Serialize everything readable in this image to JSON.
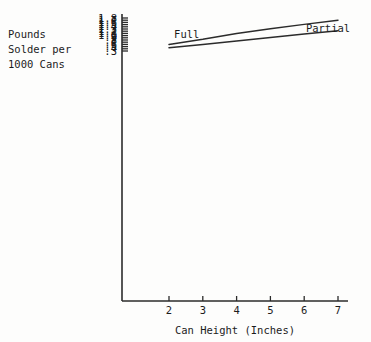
{
  "chart_data": {
    "type": "line",
    "title": "",
    "xlabel": "Can Height (Inches)",
    "ylabel": "Pounds Solder per 1000 Cans",
    "ylabel_lines": [
      "Pounds",
      "Solder per",
      "1000 Cans"
    ],
    "xlim": [
      1.5,
      7.5
    ],
    "ylim": [
      0.25,
      1.85
    ],
    "grid": false,
    "legend_position": "inline-annotations",
    "x_ticks": [
      2,
      3,
      4,
      5,
      6,
      7
    ],
    "x_tick_labels": [
      "2",
      "3",
      "4",
      "5",
      "6",
      "7"
    ],
    "y_ticks": [
      0.3,
      0.4,
      0.5,
      0.6,
      0.7,
      0.8,
      0.9,
      1.0,
      1.1,
      1.2,
      1.3,
      1.4,
      1.5,
      1.6,
      1.7,
      1.8
    ],
    "y_tick_labels": [
      ".3",
      ".4",
      ".5",
      ".6",
      ".7",
      ".8",
      ".9",
      "1.0",
      "1.1",
      "1.2",
      "1.3",
      "1.4",
      "1.5",
      "1.6",
      "1.7",
      "1.8"
    ],
    "series": [
      {
        "name": "Full",
        "label": "Full",
        "color": "#2b2b2b",
        "x": [
          2,
          3,
          4,
          5,
          6,
          7
        ],
        "values": [
          0.6,
          0.83,
          1.1,
          1.31,
          1.51,
          1.7
        ]
      },
      {
        "name": "Partial",
        "label": "Partial",
        "color": "#2b2b2b",
        "x": [
          2,
          3,
          4,
          5,
          6,
          7
        ],
        "values": [
          0.45,
          0.6,
          0.76,
          0.91,
          1.07,
          1.22
        ]
      }
    ],
    "annotations": [
      {
        "text": "Full",
        "x": 2.15,
        "y": 0.88
      },
      {
        "text": "Partial",
        "x": 6.05,
        "y": 1.17
      }
    ]
  }
}
